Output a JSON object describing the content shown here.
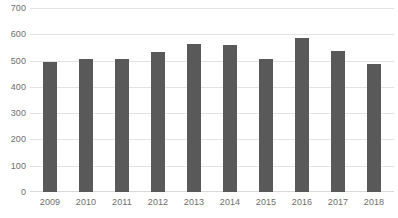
{
  "chart_data": {
    "type": "bar",
    "title": "",
    "subtitle": "",
    "xlabel": "",
    "ylabel": "",
    "categories": [
      "2009",
      "2010",
      "2011",
      "2012",
      "2013",
      "2014",
      "2015",
      "2016",
      "2017",
      "2018"
    ],
    "values": [
      494,
      506,
      508,
      532,
      564,
      559,
      505,
      585,
      538,
      487
    ],
    "series": [
      {
        "name": "",
        "values": [
          494,
          506,
          508,
          532,
          564,
          559,
          505,
          585,
          538,
          487
        ],
        "color": "#595959"
      }
    ],
    "ylim": [
      0,
      700
    ],
    "yticks": [
      0,
      100,
      200,
      300,
      400,
      500,
      600,
      700
    ],
    "ytick_labels": [
      "0",
      "100",
      "200",
      "300",
      "400",
      "500",
      "600",
      "700"
    ],
    "xtick_labels": [
      "2009",
      "2010",
      "2011",
      "2012",
      "2013",
      "2014",
      "2015",
      "2016",
      "2017",
      "2018"
    ],
    "grid": true,
    "grid_axis": "y",
    "legend": false,
    "legend_position": "none",
    "annotations": [],
    "colors": {
      "bar": "#595959",
      "gridline": "#e3e3e3",
      "baseline": "#d9d9d9",
      "tick_label": "#6e6e6e",
      "background": "#ffffff"
    }
  }
}
